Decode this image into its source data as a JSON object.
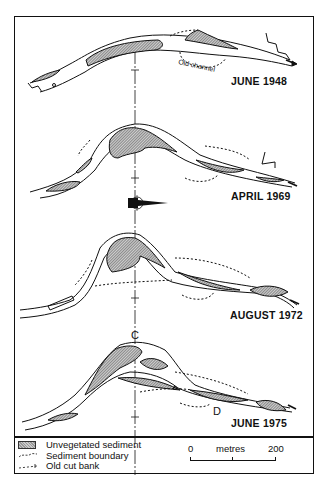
{
  "figure": {
    "panels": [
      {
        "label": "JUNE 1948",
        "annotation": "Old channel"
      },
      {
        "label": "APRIL 1969"
      },
      {
        "label": "AUGUST 1972"
      },
      {
        "label": "JUNE 1975",
        "markers": [
          "C",
          "D"
        ]
      }
    ],
    "north_arrow": {
      "letter": "N"
    },
    "legend": {
      "items": [
        {
          "symbol": "hatched-swatch",
          "label": "Unvegetated sediment"
        },
        {
          "symbol": "dashed-line",
          "label": "Sediment boundary"
        },
        {
          "symbol": "cross-dashed-line",
          "label": "Old cut bank"
        }
      ]
    },
    "scale_bar": {
      "start": "0",
      "unit": "metres",
      "end": "200"
    },
    "colors": {
      "ink": "#111111",
      "sediment_fill": "#b0b0b0"
    }
  }
}
